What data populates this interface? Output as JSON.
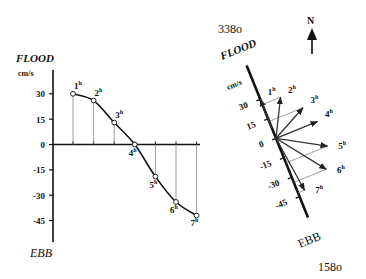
{
  "left_chart": {
    "top_label": "FLOOD",
    "bottom_label": "EBB",
    "unit": "cm/s",
    "y_ticks": [
      30,
      15,
      0,
      -15,
      -30,
      -45
    ],
    "ylim": [
      -50,
      37
    ]
  },
  "right_chart": {
    "top_label": "FLOOD",
    "bottom_label": "EBB",
    "unit": "cm/s",
    "flood_bearing": "338o",
    "ebb_bearing": "158o",
    "axis_ticks": [
      30,
      15,
      0,
      -15,
      -30,
      -45
    ],
    "north_label": "N"
  },
  "chart_data": {
    "type": "line",
    "title": "",
    "xlabel": "",
    "ylabel": "cm/s",
    "x": [
      "1h",
      "2h",
      "3h",
      "4h",
      "5h",
      "6h",
      "7h"
    ],
    "series": [
      {
        "name": "Tidal current speed (along-axis)",
        "values": [
          30,
          26,
          13,
          0,
          -19,
          -34,
          -42
        ]
      }
    ],
    "ylim": [
      -50,
      37
    ],
    "y_ticks": [
      30,
      15,
      0,
      -15,
      -30,
      -45
    ],
    "annotations": [
      "FLOOD",
      "EBB"
    ],
    "vectors": {
      "axis_bearing_flood_deg": 338,
      "axis_bearing_ebb_deg": 158,
      "labels": [
        "1h",
        "2h",
        "3h",
        "4h",
        "5h",
        "6h",
        "7h"
      ],
      "along_axis_cm_s": [
        30,
        26,
        13,
        0,
        -19,
        -34,
        -42
      ],
      "cross_axis_cm_s": [
        0,
        14,
        26,
        32,
        32,
        25,
        5
      ]
    }
  }
}
